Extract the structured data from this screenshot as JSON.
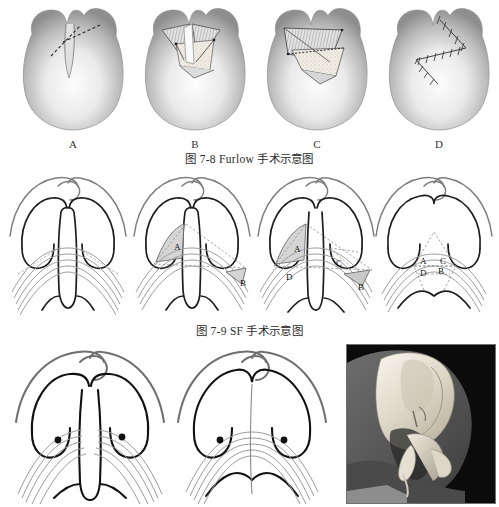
{
  "figure": {
    "domain_note": "medical textbook illustration page",
    "captions": [
      {
        "id": "fig-7-8",
        "text": "图 7-8  Furlow 手术示意图"
      },
      {
        "id": "fig-7-9",
        "text": "图 7-9  SF 手术示意图"
      }
    ]
  },
  "row_top": {
    "name": "furlow-double-opposing-z-plasty-series",
    "panels": [
      {
        "label": "A",
        "name": "panel-a-incision-design",
        "description": "cleft palate with dashed Z-plasty incision lines marked"
      },
      {
        "label": "B",
        "name": "panel-b-flaps-elevated",
        "description": "opposing triangular myomucosal flaps raised, hatched undersurface"
      },
      {
        "label": "C",
        "name": "panel-c-flaps-transposed",
        "description": "flaps transposed across the cleft, hatched muscle layer"
      },
      {
        "label": "D",
        "name": "panel-d-closure-sutured",
        "description": "completed Z-plasty closure with interrupted sutures"
      }
    ]
  },
  "row_middle": {
    "name": "sphincter-pharyngoplasty-series",
    "panels": [
      {
        "name": "sf-step-1",
        "flap_labels": []
      },
      {
        "name": "sf-step-2",
        "flap_labels": [
          "A",
          "B"
        ]
      },
      {
        "name": "sf-step-3",
        "flap_labels": [
          "A",
          "B",
          "C",
          "D"
        ]
      },
      {
        "name": "sf-step-4",
        "flap_labels": [
          "A",
          "B",
          "C",
          "D"
        ]
      }
    ]
  },
  "row_bottom": {
    "name": "velopharyngeal-result-series",
    "panels": [
      {
        "name": "bottom-left-preop",
        "markers": 2,
        "description": "palate with paired dark marker dots and muscle fibre bundles"
      },
      {
        "name": "bottom-right-postop",
        "markers": 2,
        "description": "midline closed palate with paired marker dots and vertical midline"
      }
    ],
    "photograph": {
      "name": "cadaver-specimen-photograph",
      "description": "black and white photograph of skull base specimen held in a hand"
    }
  },
  "colors": {
    "ink_dark": "#1a1a1a",
    "ink_gray": "#8a8a8a",
    "flap_fill": "#d8d8d8",
    "photo_border": "#6f6f6f",
    "page_background": "#ffffff"
  }
}
